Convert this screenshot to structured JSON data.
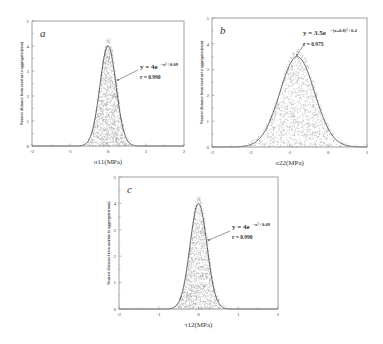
{
  "chart_data": [
    {
      "id": "a",
      "type": "scatter",
      "panel_label": "a",
      "xlabel": "σ11(MPa)",
      "ylabel": "Nearest distance from mortar to aggregates(mm)",
      "xlim": [
        -2,
        2
      ],
      "ylim": [
        0,
        5
      ],
      "xticks": [
        -2,
        -1,
        0,
        1,
        2
      ],
      "yticks": [
        0,
        1,
        2,
        3,
        4,
        5
      ],
      "fit": {
        "amplitude": 4,
        "center": 0,
        "denominator": 0.09,
        "equation_main": "y = 4e",
        "equation_exp": "−x² / 0.09",
        "r_label": "r = 0.990"
      },
      "scatter_spread": 0.22,
      "frame": {
        "left": 32,
        "top": 21,
        "right": 184,
        "bottom": 146
      },
      "annotation": {
        "text_x": 140,
        "text_y": 69,
        "r_y": 79,
        "arrow_from": [
          138,
          70
        ],
        "arrow_to": [
          118,
          80
        ]
      }
    },
    {
      "id": "b",
      "type": "scatter",
      "panel_label": "b",
      "xlabel": "σ22(MPa)",
      "ylabel": "Nearest distance from mortar to aggregates(mm)",
      "xlim": [
        -3,
        1
      ],
      "ylim": [
        0,
        5
      ],
      "xticks": [
        -3,
        -2,
        -1,
        0,
        1
      ],
      "yticks": [
        0,
        1,
        2,
        3,
        4,
        5
      ],
      "fit": {
        "amplitude": 3.5,
        "center": -0.8,
        "denominator": 0.4,
        "equation_main": "y = 3.5e",
        "equation_exp": "−(x+0.8)² / 0.4",
        "r_label": "r = 0.975"
      },
      "scatter_spread": 0.45,
      "frame": {
        "left": 212,
        "top": 18,
        "right": 367,
        "bottom": 147
      },
      "annotation": {
        "text_x": 303,
        "text_y": 35,
        "r_y": 46,
        "arrow_from": [
          305,
          43
        ],
        "arrow_to": [
          297,
          55
        ]
      }
    },
    {
      "id": "c",
      "type": "scatter",
      "panel_label": "c",
      "xlabel": "τ12(MPa)",
      "ylabel": "Nearest distance from mortar to aggregates(mm)",
      "xlim": [
        -2,
        2
      ],
      "ylim": [
        0,
        5
      ],
      "xticks": [
        -2,
        -1,
        0,
        1,
        2
      ],
      "yticks": [
        0,
        1,
        2,
        3,
        4,
        5
      ],
      "fit": {
        "amplitude": 4,
        "center": 0,
        "denominator": 0.09,
        "equation_main": "y = 4e",
        "equation_exp": "−x² / 0.09",
        "r_label": "r = 0.990"
      },
      "scatter_spread": 0.22,
      "frame": {
        "left": 119,
        "top": 177,
        "right": 278,
        "bottom": 309
      },
      "annotation": {
        "text_x": 232,
        "text_y": 229,
        "r_y": 239,
        "arrow_from": [
          230,
          231
        ],
        "arrow_to": [
          209,
          240
        ]
      }
    }
  ],
  "colors": {
    "frame": "#888888",
    "curve": "#555555",
    "scatter": "#9a9a9a",
    "text": "#333333"
  }
}
